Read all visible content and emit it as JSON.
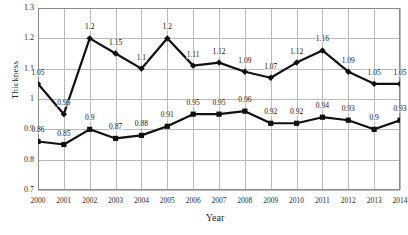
{
  "chart_data": {
    "type": "line",
    "title": "",
    "xlabel": "Year",
    "ylabel": "Thickness",
    "categories": [
      "2000",
      "2001",
      "2002",
      "2003",
      "2004",
      "2005",
      "2006",
      "2007",
      "2008",
      "2009",
      "2010",
      "2011",
      "2012",
      "2013",
      "2014"
    ],
    "ylim": [
      0.7,
      1.3
    ],
    "yticks": [
      "0.7",
      "0.8",
      "0.9",
      "1",
      "1.1",
      "1.2",
      "1.3"
    ],
    "grid": true,
    "legend": "none",
    "series": [
      {
        "name": "upper-series",
        "values": [
          1.05,
          0.95,
          1.2,
          1.15,
          1.1,
          1.2,
          1.11,
          1.12,
          1.09,
          1.07,
          1.12,
          1.16,
          1.09,
          1.05,
          1.05
        ],
        "labels": [
          "1.05",
          "0.95",
          "1.2",
          "1.15",
          "1.1",
          "1.2",
          "1.11",
          "1.12",
          "1.09",
          "1.07",
          "1.12",
          "1.16",
          "1.09",
          "1.05",
          "1.05"
        ],
        "color": "#111111",
        "marker": "diamond"
      },
      {
        "name": "lower-series",
        "values": [
          0.86,
          0.85,
          0.9,
          0.87,
          0.88,
          0.91,
          0.95,
          0.95,
          0.96,
          0.92,
          0.92,
          0.94,
          0.93,
          0.9,
          0.93
        ],
        "labels": [
          "0.86",
          "0.85",
          "0.9",
          "0.87",
          "0.88",
          "0.91",
          "0.95",
          "0.95",
          "0.96",
          "0.92",
          "0.92",
          "0.94",
          "0.93",
          "0.9",
          "0.93"
        ],
        "color": "#111111",
        "marker": "square"
      }
    ],
    "colors": {
      "grid": "#b9b9b9",
      "axis": "#8a8a8a",
      "series": "#111111",
      "background": "#ffffff"
    }
  }
}
